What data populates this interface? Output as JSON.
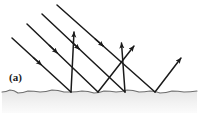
{
  "figure": {
    "panel_label": "(a)",
    "caption_visible": false,
    "background_color": "#ffffff",
    "ink_color": "#1a1a1a",
    "substrate_fill": "#f2f2f2",
    "substrate_edge_color": "#6e6e6e",
    "width": 199,
    "height": 113
  },
  "chart_data": {
    "type": "diagram",
    "title": "(a)",
    "coordinate_space": {
      "x": [
        0,
        199
      ],
      "y": [
        0,
        113
      ],
      "origin": "top-left",
      "units": "px"
    },
    "surface": {
      "name": "rough-surface",
      "description": "irregular wavy boundary line spanning the full width",
      "points": [
        [
          2,
          92
        ],
        [
          10,
          90
        ],
        [
          18,
          93
        ],
        [
          28,
          91
        ],
        [
          40,
          92
        ],
        [
          52,
          90
        ],
        [
          64,
          92
        ],
        [
          71,
          92
        ],
        [
          82,
          91
        ],
        [
          94,
          93
        ],
        [
          104,
          91
        ],
        [
          116,
          92
        ],
        [
          127,
          90
        ],
        [
          139,
          92
        ],
        [
          150,
          91
        ],
        [
          160,
          93
        ],
        [
          172,
          91
        ],
        [
          184,
          92
        ],
        [
          197,
          91
        ]
      ],
      "fill_below": true
    },
    "incident_rays": [
      {
        "id": "incident-1",
        "from": [
          12,
          38
        ],
        "to": [
          71,
          92
        ],
        "arrow_at": [
          41,
          65
        ],
        "direction": "down-right"
      },
      {
        "id": "incident-2",
        "from": [
          27,
          24
        ],
        "to": [
          98,
          92
        ],
        "arrow_at": [
          58,
          53
        ],
        "direction": "down-right"
      },
      {
        "id": "incident-3",
        "from": [
          42,
          14
        ],
        "to": [
          125,
          92
        ],
        "arrow_at": [
          80,
          50
        ],
        "direction": "down-right"
      },
      {
        "id": "incident-4",
        "from": [
          57,
          5
        ],
        "to": [
          155,
          92
        ],
        "arrow_at": [
          104,
          47
        ],
        "direction": "down-right"
      }
    ],
    "reflected_rays": [
      {
        "id": "reflected-1",
        "from": [
          71,
          92
        ],
        "to": [
          74,
          30
        ],
        "arrow_at": [
          74,
          30
        ],
        "direction": "up"
      },
      {
        "id": "reflected-2",
        "from": [
          98,
          92
        ],
        "to": [
          136,
          44
        ],
        "arrow_at": [
          136,
          44
        ],
        "direction": "up-right"
      },
      {
        "id": "reflected-3",
        "from": [
          125,
          92
        ],
        "to": [
          121,
          41
        ],
        "arrow_at": [
          121,
          41
        ],
        "direction": "up-slightly-left"
      },
      {
        "id": "reflected-4",
        "from": [
          155,
          92
        ],
        "to": [
          183,
          56
        ],
        "arrow_at": [
          183,
          56
        ],
        "direction": "up-right"
      }
    ],
    "counts": {
      "incident_rays": 4,
      "reflected_rays": 4,
      "surface_contact_points": 4
    },
    "contact_points": [
      [
        71,
        92
      ],
      [
        98,
        92
      ],
      [
        125,
        92
      ],
      [
        155,
        92
      ]
    ],
    "legend": [],
    "annotations": [
      "(a)"
    ]
  }
}
